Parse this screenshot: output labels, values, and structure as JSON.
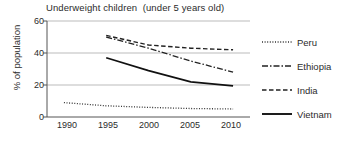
{
  "chart_data": {
    "type": "line",
    "title": "Underweight children  (under 5 years old)",
    "xlabel": "",
    "ylabel": "% of population",
    "xlim": [
      1988,
      2012
    ],
    "ylim": [
      0,
      60
    ],
    "xticks": [
      "1990",
      "1995",
      "2000",
      "2005",
      "2010"
    ],
    "yticks": [
      "0",
      "20",
      "40",
      "60"
    ],
    "grid": "horizontal",
    "legend_position": "right",
    "series": [
      {
        "name": "Peru",
        "style": "dotted",
        "color": "#333333",
        "x": [
          1990,
          1995,
          2000,
          2005,
          2010
        ],
        "values": [
          9,
          7,
          6,
          5.3,
          5
        ]
      },
      {
        "name": "Ethiopia",
        "style": "dash-dot",
        "color": "#222222",
        "x": [
          1995,
          2000,
          2005,
          2010
        ],
        "values": [
          50,
          43,
          35,
          28
        ]
      },
      {
        "name": "India",
        "style": "dashed",
        "color": "#222222",
        "x": [
          1995,
          2000,
          2005,
          2010
        ],
        "values": [
          51,
          45,
          43,
          42
        ]
      },
      {
        "name": "Vietnam",
        "style": "solid",
        "color": "#111111",
        "x": [
          1995,
          2000,
          2005,
          2010
        ],
        "values": [
          37,
          29,
          22,
          19.5
        ]
      }
    ]
  },
  "legend": {
    "items": [
      {
        "label": "Peru"
      },
      {
        "label": "Ethiopia"
      },
      {
        "label": "India"
      },
      {
        "label": "Vietnam"
      }
    ]
  },
  "axes": {
    "y_ticks": [
      {
        "label": "60"
      },
      {
        "label": "40"
      },
      {
        "label": "20"
      },
      {
        "label": "0"
      }
    ],
    "x_ticks": [
      {
        "label": "1990"
      },
      {
        "label": "1995"
      },
      {
        "label": "2000"
      },
      {
        "label": "2005"
      },
      {
        "label": "2010"
      }
    ]
  },
  "colors": {
    "axis": "#555555",
    "grid": "#bbbbbb",
    "text": "#2b2b2b"
  }
}
